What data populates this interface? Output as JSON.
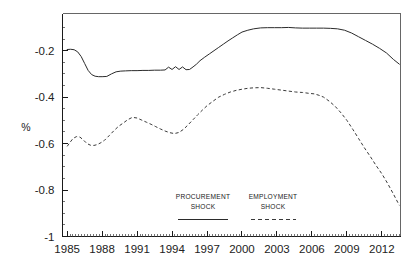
{
  "chart_data": {
    "type": "line",
    "title": "",
    "xlabel": "",
    "ylabel": "%",
    "xlim": [
      1984.6,
      2013.6
    ],
    "ylim": [
      -1.0,
      -0.04
    ],
    "grid": false,
    "legend_position": "inside-bottom-center",
    "y_ticks": [
      "-0.2",
      "-0.4",
      "-0.6",
      "-0.8",
      "-1"
    ],
    "y_tick_values": [
      -0.2,
      -0.4,
      -0.6,
      -0.8,
      -1.0
    ],
    "x_ticks": [
      "1985",
      "1988",
      "1991",
      "1994",
      "1997",
      "2000",
      "2003",
      "2006",
      "2009",
      "2012"
    ],
    "x_tick_values": [
      1985,
      1988,
      1991,
      1994,
      1997,
      2000,
      2003,
      2006,
      2009,
      2012
    ],
    "series": [
      {
        "name": "PROCUREMENT SHOCK",
        "style": "solid",
        "color": "#2b2b2b",
        "x": [
          1985.0,
          1985.3,
          1985.6,
          1985.9,
          1986.2,
          1986.5,
          1986.8,
          1987.1,
          1987.4,
          1987.7,
          1988.0,
          1988.4,
          1988.8,
          1989.2,
          1989.6,
          1990.0,
          1990.5,
          1991.0,
          1991.5,
          1992.0,
          1992.5,
          1993.0,
          1993.4,
          1993.7,
          1994.0,
          1994.3,
          1994.6,
          1994.9,
          1995.2,
          1995.5,
          1995.8,
          1996.1,
          1996.4,
          1996.8,
          1997.2,
          1997.6,
          1998.0,
          1998.4,
          1998.8,
          1999.2,
          1999.6,
          2000.0,
          2000.5,
          2001.0,
          2001.6,
          2002.2,
          2002.8,
          2003.4,
          2004.0,
          2004.6,
          2005.2,
          2005.8,
          2006.4,
          2007.0,
          2007.6,
          2008.2,
          2008.8,
          2009.4,
          2010.0,
          2010.6,
          2011.2,
          2011.8,
          2012.4,
          2013.0,
          2013.5
        ],
        "y": [
          -0.195,
          -0.194,
          -0.196,
          -0.205,
          -0.225,
          -0.255,
          -0.285,
          -0.303,
          -0.31,
          -0.312,
          -0.312,
          -0.311,
          -0.3,
          -0.291,
          -0.288,
          -0.287,
          -0.286,
          -0.286,
          -0.285,
          -0.285,
          -0.284,
          -0.284,
          -0.283,
          -0.271,
          -0.281,
          -0.269,
          -0.281,
          -0.27,
          -0.282,
          -0.281,
          -0.27,
          -0.258,
          -0.243,
          -0.228,
          -0.214,
          -0.2,
          -0.186,
          -0.172,
          -0.158,
          -0.145,
          -0.132,
          -0.12,
          -0.112,
          -0.106,
          -0.102,
          -0.101,
          -0.101,
          -0.101,
          -0.1,
          -0.102,
          -0.103,
          -0.103,
          -0.103,
          -0.103,
          -0.104,
          -0.106,
          -0.112,
          -0.124,
          -0.14,
          -0.156,
          -0.172,
          -0.19,
          -0.21,
          -0.238,
          -0.258
        ]
      },
      {
        "name": "EMPLOYMENT SHOCK",
        "style": "dashed",
        "color": "#3a3a3a",
        "x": [
          1985.0,
          1985.2,
          1985.5,
          1985.8,
          1986.1,
          1986.4,
          1986.7,
          1987.0,
          1987.3,
          1987.6,
          1987.9,
          1988.2,
          1988.6,
          1989.0,
          1989.4,
          1989.8,
          1990.2,
          1990.6,
          1991.0,
          1991.4,
          1991.8,
          1992.2,
          1992.6,
          1993.0,
          1993.4,
          1993.8,
          1994.2,
          1994.6,
          1995.0,
          1995.4,
          1995.8,
          1996.2,
          1996.6,
          1997.0,
          1997.5,
          1998.0,
          1998.5,
          1999.0,
          1999.5,
          2000.0,
          2000.5,
          2001.0,
          2001.6,
          2002.2,
          2002.8,
          2003.4,
          2004.0,
          2004.6,
          2005.2,
          2005.8,
          2006.2,
          2006.6,
          2007.0,
          2007.5,
          2008.0,
          2008.5,
          2009.0,
          2009.5,
          2010.0,
          2010.5,
          2011.0,
          2011.5,
          2012.0,
          2012.5,
          2013.0,
          2013.5
        ],
        "y": [
          -0.612,
          -0.598,
          -0.578,
          -0.57,
          -0.572,
          -0.585,
          -0.6,
          -0.607,
          -0.608,
          -0.604,
          -0.596,
          -0.586,
          -0.566,
          -0.545,
          -0.526,
          -0.512,
          -0.497,
          -0.487,
          -0.49,
          -0.499,
          -0.508,
          -0.517,
          -0.527,
          -0.537,
          -0.546,
          -0.553,
          -0.557,
          -0.552,
          -0.538,
          -0.518,
          -0.497,
          -0.476,
          -0.456,
          -0.437,
          -0.418,
          -0.4,
          -0.388,
          -0.378,
          -0.371,
          -0.366,
          -0.362,
          -0.36,
          -0.359,
          -0.362,
          -0.366,
          -0.37,
          -0.374,
          -0.378,
          -0.38,
          -0.384,
          -0.386,
          -0.392,
          -0.4,
          -0.418,
          -0.44,
          -0.468,
          -0.5,
          -0.538,
          -0.578,
          -0.618,
          -0.655,
          -0.694,
          -0.73,
          -0.772,
          -0.818,
          -0.866
        ]
      }
    ],
    "annotations": []
  },
  "legend": {
    "entries": [
      {
        "line1": "PROCUREMENT",
        "line2": "SHOCK",
        "style": "solid"
      },
      {
        "line1": "EMPLOYMENT",
        "line2": "SHOCK",
        "style": "dashed"
      }
    ]
  },
  "axes": {
    "y_label": "%"
  }
}
